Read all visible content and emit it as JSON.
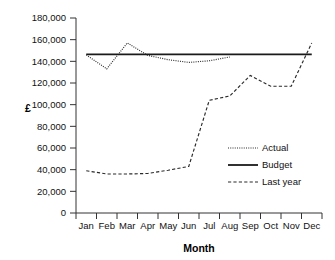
{
  "chart_data": {
    "type": "line",
    "title": "",
    "xlabel": "Month",
    "ylabel": "£",
    "categories": [
      "Jan",
      "Feb",
      "Mar",
      "Apr",
      "May",
      "Jun",
      "Jul",
      "Aug",
      "Sep",
      "Oct",
      "Nov",
      "Dec"
    ],
    "ylim": [
      0,
      180000
    ],
    "ytick_step": 20000,
    "ytick_labels": [
      "0",
      "20,000",
      "40,000",
      "60,000",
      "80,000",
      "100,000",
      "120,000",
      "140,000",
      "160,000",
      "180,000"
    ],
    "ytick_values": [
      0,
      20000,
      40000,
      60000,
      80000,
      100000,
      120000,
      140000,
      160000,
      180000
    ],
    "grid": false,
    "legend_position": "inside-right",
    "series": [
      {
        "name": "Actual",
        "style": "dotted",
        "color": "#2a2a2a",
        "x": [
          "Jan",
          "Feb",
          "Mar",
          "Apr",
          "May",
          "Jun",
          "Jul",
          "Aug"
        ],
        "values": [
          146000,
          133000,
          157000,
          145500,
          141500,
          139000,
          140500,
          144000
        ]
      },
      {
        "name": "Budget",
        "style": "solid",
        "color": "#1a1a1a",
        "x": [
          "Jan",
          "Feb",
          "Mar",
          "Apr",
          "May",
          "Jun",
          "Jul",
          "Aug",
          "Sep",
          "Oct",
          "Nov",
          "Dec"
        ],
        "values": [
          146500,
          146500,
          146500,
          146500,
          146500,
          146500,
          146500,
          146500,
          146500,
          146500,
          146500,
          146500
        ]
      },
      {
        "name": "Last year",
        "style": "dashed",
        "color": "#2a2a2a",
        "x": [
          "Jan",
          "Feb",
          "Mar",
          "Apr",
          "May",
          "Jun",
          "Jul",
          "Aug",
          "Sep",
          "Oct",
          "Nov",
          "Dec"
        ],
        "values": [
          39000,
          36000,
          36000,
          36500,
          39500,
          43000,
          104000,
          108000,
          127000,
          117000,
          117000,
          157000
        ]
      }
    ]
  },
  "legend": {
    "items": [
      {
        "label": "Actual"
      },
      {
        "label": "Budget"
      },
      {
        "label": "Last year"
      }
    ]
  },
  "axes": {
    "x_title": "Month",
    "y_title": "£"
  }
}
